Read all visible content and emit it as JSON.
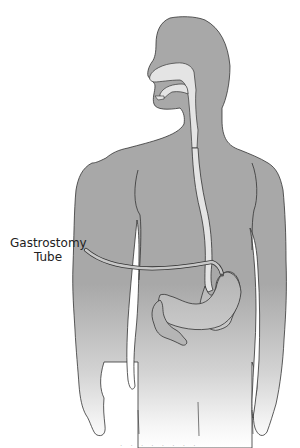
{
  "figure": {
    "labels": {
      "gastrostomy_tube_line1": "Gastrostomy",
      "gastrostomy_tube_line2": "Tube"
    },
    "caption": ". . . .   . . .   .",
    "colors": {
      "body_fill": "#a9a9a9",
      "body_fill_fade": "#ffffff",
      "outline": "#333333",
      "esophagus_fill": "#e4e4e4",
      "stomach_fill": "#b8b8b8",
      "tube_fill": "#c8c8c8"
    }
  }
}
